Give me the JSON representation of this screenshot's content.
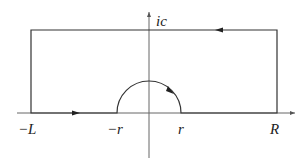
{
  "diagram": {
    "colors": {
      "line": "#333333",
      "background": "#ffffff",
      "text": "#222222"
    },
    "labels": {
      "imag_axis": "ic",
      "left_end": "−L",
      "left_indent": "−r",
      "right_indent": "r",
      "right_end": "R"
    },
    "geometry": {
      "origin": [
        149,
        113
      ],
      "real_axis_x_range": [
        17,
        295
      ],
      "imag_axis_y_range": [
        12,
        158
      ],
      "rectangle": {
        "left": 31,
        "top": 30,
        "right": 277,
        "bottom": 113
      },
      "semicircle_radius": 32
    },
    "arrows": [
      {
        "segment": "bottom-left",
        "direction": "right"
      },
      {
        "segment": "top",
        "direction": "left"
      },
      {
        "segment": "semicircle",
        "direction": "clockwise"
      }
    ]
  }
}
